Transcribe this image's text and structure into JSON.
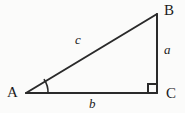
{
  "figure": {
    "kind": "right-triangle-diagram",
    "width": 185,
    "height": 113,
    "background_color": "#fbfbfa",
    "stroke_color": "#2a2a2a",
    "stroke_width": 2,
    "text_color": "#1c1c1c"
  },
  "vertices": {
    "a": {
      "label": "A",
      "x": 26,
      "y": 93
    },
    "b": {
      "label": "B",
      "x": 157,
      "y": 14
    },
    "c": {
      "label": "C",
      "x": 157,
      "y": 93
    }
  },
  "sides": {
    "hypotenuse": {
      "label": "c",
      "from": "A",
      "to": "B"
    },
    "opposite": {
      "label": "a",
      "from": "B",
      "to": "C"
    },
    "adjacent": {
      "label": "b",
      "from": "A",
      "to": "C"
    }
  },
  "markers": {
    "right_angle": {
      "at": "C",
      "name": "right-angle-square",
      "size": 9
    },
    "angle_arc": {
      "at": "A",
      "name": "angle-arc-a",
      "radius": 22
    }
  }
}
